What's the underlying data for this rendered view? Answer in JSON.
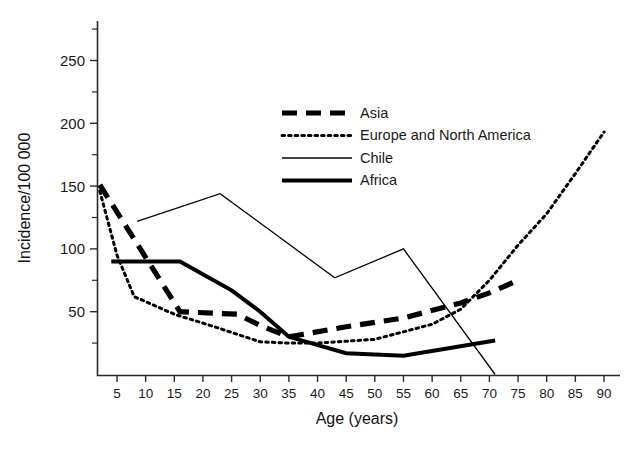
{
  "chart_data": {
    "type": "line",
    "title": "",
    "xlabel": "Age (years)",
    "ylabel": "Incidence/100 000",
    "xlim": [
      0,
      90
    ],
    "ylim": [
      0,
      275
    ],
    "grid": false,
    "legend_position": "upper-center",
    "xticks": [
      5,
      10,
      15,
      20,
      25,
      30,
      35,
      40,
      45,
      50,
      55,
      60,
      65,
      70,
      75,
      80,
      85,
      90
    ],
    "xtick_labels": [
      "5",
      "10",
      "15",
      "20",
      "25",
      "30",
      "35",
      "40",
      "45",
      "50",
      "55",
      "60",
      "65",
      "70",
      "75",
      "80",
      "85",
      "90"
    ],
    "yticks": [
      50,
      100,
      150,
      200,
      250
    ],
    "ytick_labels": [
      "50",
      "100",
      "150",
      "200",
      "250"
    ],
    "yticks_minor": [
      25,
      75,
      125,
      175,
      225,
      275
    ],
    "series": [
      {
        "name": "Asia",
        "style": "thick-dashed",
        "points": [
          {
            "x": 2,
            "y": 151
          },
          {
            "x": 16,
            "y": 50
          },
          {
            "x": 26,
            "y": 48
          },
          {
            "x": 30,
            "y": 39
          },
          {
            "x": 35,
            "y": 30
          },
          {
            "x": 45,
            "y": 38
          },
          {
            "x": 55,
            "y": 45
          },
          {
            "x": 65,
            "y": 57
          },
          {
            "x": 70,
            "y": 65
          },
          {
            "x": 75,
            "y": 75
          }
        ]
      },
      {
        "name": "Europe and North America",
        "style": "dotted",
        "points": [
          {
            "x": 2,
            "y": 146
          },
          {
            "x": 5,
            "y": 95
          },
          {
            "x": 8,
            "y": 62
          },
          {
            "x": 15,
            "y": 48
          },
          {
            "x": 22,
            "y": 38
          },
          {
            "x": 30,
            "y": 26
          },
          {
            "x": 35,
            "y": 25
          },
          {
            "x": 40,
            "y": 25
          },
          {
            "x": 50,
            "y": 28
          },
          {
            "x": 60,
            "y": 40
          },
          {
            "x": 65,
            "y": 52
          },
          {
            "x": 70,
            "y": 75
          },
          {
            "x": 75,
            "y": 103
          },
          {
            "x": 80,
            "y": 128
          },
          {
            "x": 85,
            "y": 160
          },
          {
            "x": 90,
            "y": 193
          }
        ]
      },
      {
        "name": "Chile",
        "style": "thin-solid",
        "points": [
          {
            "x": 8.5,
            "y": 122
          },
          {
            "x": 23,
            "y": 144
          },
          {
            "x": 43,
            "y": 77
          },
          {
            "x": 55,
            "y": 100
          },
          {
            "x": 71,
            "y": 0
          }
        ]
      },
      {
        "name": "Africa",
        "style": "thick-solid",
        "points": [
          {
            "x": 4,
            "y": 90
          },
          {
            "x": 16,
            "y": 90
          },
          {
            "x": 25,
            "y": 67
          },
          {
            "x": 30,
            "y": 50
          },
          {
            "x": 35,
            "y": 30
          },
          {
            "x": 45,
            "y": 17
          },
          {
            "x": 55,
            "y": 15
          },
          {
            "x": 71,
            "y": 27
          }
        ]
      }
    ],
    "legend": [
      {
        "label": "Asia",
        "style": "thick-dashed"
      },
      {
        "label": "Europe and North America",
        "style": "dotted"
      },
      {
        "label": "Chile",
        "style": "thin-solid"
      },
      {
        "label": "Africa",
        "style": "thick-solid"
      }
    ]
  }
}
